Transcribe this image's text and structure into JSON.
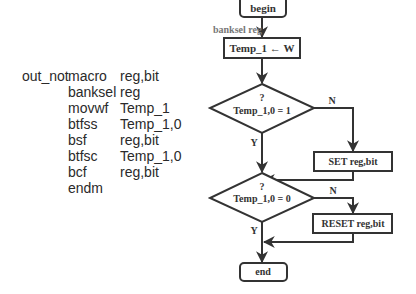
{
  "code": {
    "lines": [
      {
        "label": "out_not",
        "op": "macro",
        "arg": "reg,bit"
      },
      {
        "label": "",
        "op": "banksel",
        "arg": "reg"
      },
      {
        "label": "",
        "op": "movwf",
        "arg": "Temp_1"
      },
      {
        "label": "",
        "op": "btfss",
        "arg": "Temp_1,0"
      },
      {
        "label": "",
        "op": "bsf",
        "arg": "reg,bit"
      },
      {
        "label": "",
        "op": "btfsc",
        "arg": "Temp_1,0"
      },
      {
        "label": "",
        "op": "bcf",
        "arg": "reg,bit"
      },
      {
        "label": "",
        "op": "endm",
        "arg": ""
      }
    ]
  },
  "flowchart": {
    "begin": "begin",
    "banksel_label": "banksel reg",
    "assign": "Temp_1 ← W",
    "decision1": {
      "q": "?",
      "cond": "Temp_1,0 = 1",
      "no": "N",
      "yes": "Y"
    },
    "set_box": "SET reg,bit",
    "decision2": {
      "q": "?",
      "cond": "Temp_1,0 = 0",
      "no": "N",
      "yes": "Y"
    },
    "reset_box": "RESET reg,bit",
    "end": "end"
  }
}
